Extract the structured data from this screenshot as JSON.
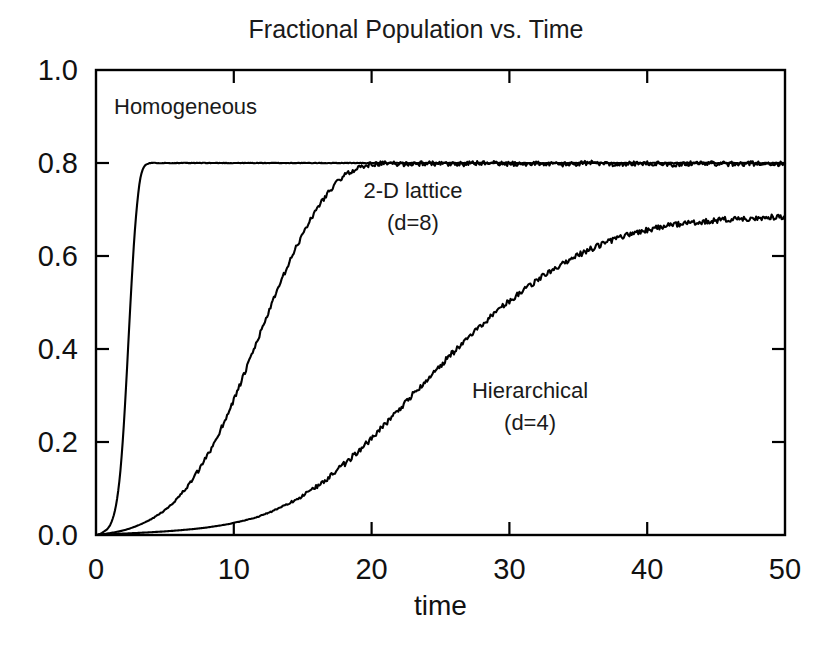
{
  "chart_data": {
    "type": "line",
    "title": "Fractional Population vs. Time",
    "xlabel": "time",
    "ylabel": "",
    "xlim": [
      0,
      50
    ],
    "ylim": [
      0.0,
      1.0
    ],
    "xticks": [
      0,
      10,
      20,
      30,
      40,
      50
    ],
    "xtick_labels": [
      "0",
      "10",
      "20",
      "30",
      "40",
      "50"
    ],
    "yticks": [
      0.0,
      0.2,
      0.4,
      0.6,
      0.8,
      1.0
    ],
    "ytick_labels": [
      "0.0",
      "0.2",
      "0.4",
      "0.6",
      "0.8",
      "1.0"
    ],
    "grid": false,
    "legend_position": "inline-annotations",
    "line_color": "#000000",
    "background_color": "#ffffff",
    "annotations": [
      {
        "text": "Homogeneous",
        "x": 6.5,
        "y": 0.905
      },
      {
        "text": "2-D lattice",
        "x": 23.0,
        "y": 0.725
      },
      {
        "text": "(d=8)",
        "x": 23.0,
        "y": 0.655
      },
      {
        "text": "Hierarchical",
        "x": 31.5,
        "y": 0.295
      },
      {
        "text": "(d=4)",
        "x": 31.5,
        "y": 0.225
      }
    ],
    "series": [
      {
        "name": "Homogeneous",
        "plateau": 0.8,
        "x": [
          0,
          0.4,
          0.8,
          1.0,
          1.2,
          1.4,
          1.6,
          1.8,
          2.0,
          2.2,
          2.4,
          2.6,
          2.8,
          3.0,
          3.2,
          3.4,
          3.6,
          3.8,
          4.0,
          4.5,
          5,
          6,
          8,
          10,
          15,
          20,
          25,
          30,
          35,
          40,
          45,
          50
        ],
        "values": [
          0.0,
          0.004,
          0.012,
          0.02,
          0.034,
          0.056,
          0.092,
          0.148,
          0.228,
          0.33,
          0.443,
          0.552,
          0.646,
          0.717,
          0.764,
          0.787,
          0.796,
          0.799,
          0.8,
          0.8,
          0.8,
          0.8,
          0.8,
          0.8,
          0.8,
          0.8,
          0.8,
          0.8,
          0.8,
          0.8,
          0.8,
          0.8
        ]
      },
      {
        "name": "2-D lattice (d=8)",
        "plateau": 0.8,
        "x": [
          0,
          1,
          2,
          3,
          4,
          5,
          6,
          7,
          8,
          9,
          10,
          11,
          12,
          13,
          14,
          15,
          16,
          17,
          18,
          19,
          20,
          21,
          22,
          24,
          26,
          28,
          30,
          32,
          34,
          36,
          38,
          40,
          42,
          44,
          46,
          48,
          50
        ],
        "values": [
          0.0,
          0.004,
          0.01,
          0.02,
          0.034,
          0.054,
          0.082,
          0.119,
          0.166,
          0.224,
          0.291,
          0.364,
          0.44,
          0.514,
          0.584,
          0.647,
          0.7,
          0.742,
          0.772,
          0.789,
          0.797,
          0.799,
          0.798,
          0.799,
          0.797,
          0.8,
          0.798,
          0.799,
          0.797,
          0.8,
          0.798,
          0.799,
          0.797,
          0.8,
          0.798,
          0.799,
          0.798
        ]
      },
      {
        "name": "Hierarchical (d=4)",
        "final_value": 0.685,
        "x": [
          0,
          2,
          4,
          6,
          8,
          10,
          12,
          14,
          16,
          18,
          20,
          22,
          24,
          26,
          28,
          30,
          32,
          34,
          36,
          38,
          40,
          42,
          44,
          46,
          48,
          50
        ],
        "values": [
          0.0,
          0.003,
          0.006,
          0.01,
          0.016,
          0.026,
          0.042,
          0.068,
          0.104,
          0.152,
          0.208,
          0.271,
          0.334,
          0.395,
          0.452,
          0.503,
          0.548,
          0.586,
          0.616,
          0.639,
          0.656,
          0.667,
          0.674,
          0.679,
          0.682,
          0.685
        ]
      }
    ]
  }
}
